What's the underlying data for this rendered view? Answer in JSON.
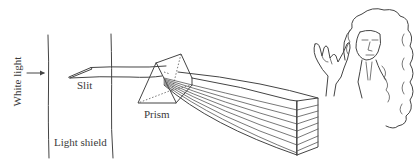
{
  "figure": {
    "labels": {
      "white_light": "White light",
      "slit": "Slit",
      "light_shield": "Light shield",
      "prism": "Prism"
    },
    "icons": {
      "arrow": "arrow-right-icon",
      "prism": "prism-icon",
      "spectrum": "spectrum-beam-icon",
      "portrait": "newton-portrait-icon"
    },
    "colors": {
      "ink": "#444444",
      "background": "#ffffff"
    }
  }
}
